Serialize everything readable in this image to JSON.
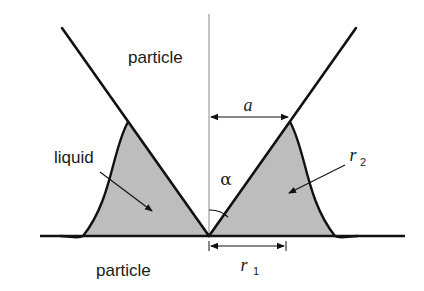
{
  "figure": {
    "labels": {
      "particle_top": "particle",
      "particle_bottom": "particle",
      "liquid": "liquid",
      "a": "a",
      "alpha": "α",
      "r1_main": "r",
      "r1_sub": "1",
      "r2_main": "r",
      "r2_sub": "2"
    },
    "colors": {
      "line": "#111111",
      "liquid_fill": "#bdbdbd",
      "axis_line": "#888888",
      "background": "#ffffff"
    },
    "geometry": {
      "vertex": [
        209,
        236
      ],
      "baseline_y": 236,
      "half_angle_symbol": "α"
    }
  }
}
